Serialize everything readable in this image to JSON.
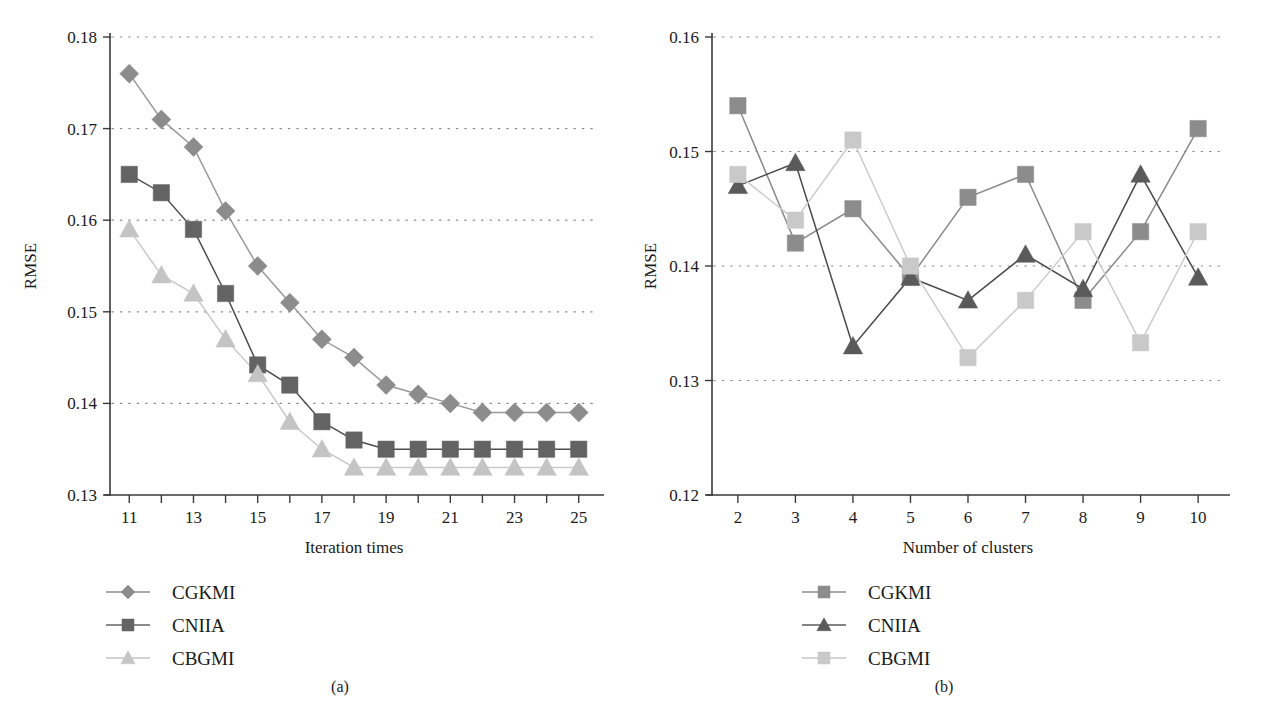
{
  "figure": {
    "background": "#ffffff",
    "panels": [
      {
        "id": "a",
        "caption": "(a)",
        "chart_data": {
          "type": "line",
          "title": "",
          "xlabel": "Iteration times",
          "ylabel": "RMSE",
          "xlim": [
            10.4,
            25.6
          ],
          "ylim": [
            0.13,
            0.18
          ],
          "xticks": [
            11,
            12,
            13,
            14,
            15,
            16,
            17,
            18,
            19,
            20,
            21,
            22,
            23,
            24,
            25
          ],
          "xticklabels": [
            "11",
            "",
            "13",
            "",
            "15",
            "",
            "17",
            "",
            "19",
            "",
            "21",
            "",
            "23",
            "",
            "25"
          ],
          "yticks": [
            0.13,
            0.14,
            0.15,
            0.16,
            0.17,
            0.18
          ],
          "yticklabels": [
            "0.13",
            "0.14",
            "0.15",
            "0.16",
            "0.17",
            "0.18"
          ],
          "grid": true,
          "grid_axis": "y",
          "legend_position": "below-left",
          "x": [
            11,
            12,
            13,
            14,
            15,
            16,
            17,
            18,
            19,
            20,
            21,
            22,
            23,
            24,
            25
          ],
          "series": [
            {
              "name": "CGKMI",
              "marker": "diamond",
              "color": "#8c8c8c",
              "line_color": "#9a9a9a",
              "values": [
                0.176,
                0.171,
                0.168,
                0.161,
                0.155,
                0.151,
                0.147,
                0.145,
                0.142,
                0.141,
                0.14,
                0.139,
                0.139,
                0.139,
                0.139
              ]
            },
            {
              "name": "CNIIA",
              "marker": "square",
              "color": "#636363",
              "line_color": "#4d4d4d",
              "values": [
                0.165,
                0.163,
                0.159,
                0.152,
                0.1442,
                0.142,
                0.138,
                0.136,
                0.135,
                0.135,
                0.135,
                0.135,
                0.135,
                0.135,
                0.135
              ]
            },
            {
              "name": "CBGMI",
              "marker": "triangle",
              "color": "#c4c4c4",
              "line_color": "#c9c9c9",
              "values": [
                0.159,
                0.154,
                0.152,
                0.147,
                0.1432,
                0.138,
                0.135,
                0.133,
                0.133,
                0.133,
                0.133,
                0.133,
                0.133,
                0.133,
                0.133
              ]
            }
          ]
        },
        "legend": [
          {
            "label": "CGKMI",
            "marker": "diamond",
            "color": "#8c8c8c"
          },
          {
            "label": "CNIIA",
            "marker": "square",
            "color": "#636363"
          },
          {
            "label": "CBGMI",
            "marker": "triangle",
            "color": "#c4c4c4"
          }
        ]
      },
      {
        "id": "b",
        "caption": "(b)",
        "chart_data": {
          "type": "line",
          "title": "",
          "xlabel": "Number of clusters",
          "ylabel": "RMSE",
          "xlim": [
            1.55,
            10.45
          ],
          "ylim": [
            0.12,
            0.16
          ],
          "xticks": [
            2,
            3,
            4,
            5,
            6,
            7,
            8,
            9,
            10
          ],
          "xticklabels": [
            "2",
            "3",
            "4",
            "5",
            "6",
            "7",
            "8",
            "9",
            "10"
          ],
          "yticks": [
            0.12,
            0.13,
            0.14,
            0.15,
            0.16
          ],
          "yticklabels": [
            "0.12",
            "0.13",
            "0.14",
            "0.15",
            "0.16"
          ],
          "grid": true,
          "grid_axis": "y",
          "legend_position": "below-center",
          "x": [
            2,
            3,
            4,
            5,
            6,
            7,
            8,
            9,
            10
          ],
          "series": [
            {
              "name": "CGKMI",
              "marker": "square",
              "color": "#8c8c8c",
              "line_color": "#8a8a8a",
              "values": [
                0.154,
                0.142,
                0.145,
                0.139,
                0.146,
                0.148,
                0.137,
                0.143,
                0.152
              ]
            },
            {
              "name": "CNIIA",
              "marker": "triangle",
              "color": "#5a5a5a",
              "line_color": "#4a4a4a",
              "values": [
                0.147,
                0.149,
                0.133,
                0.139,
                0.137,
                0.141,
                0.138,
                0.148,
                0.139
              ]
            },
            {
              "name": "CBGMI",
              "marker": "square",
              "color": "#c9c9c9",
              "line_color": "#cccccc",
              "values": [
                0.148,
                0.144,
                0.151,
                0.14,
                0.132,
                0.137,
                0.143,
                0.1333,
                0.143
              ]
            }
          ]
        },
        "legend": [
          {
            "label": "CGKMI",
            "marker": "square",
            "color": "#8c8c8c"
          },
          {
            "label": "CNIIA",
            "marker": "triangle",
            "color": "#5a5a5a"
          },
          {
            "label": "CBGMI",
            "marker": "square",
            "color": "#c9c9c9"
          }
        ]
      }
    ]
  }
}
